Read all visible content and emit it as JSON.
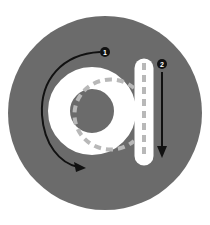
{
  "illustration": {
    "letter": "a",
    "description": "Letter tracing guide",
    "strokes": [
      {
        "number": "1",
        "direction": "counter-clockwise curve"
      },
      {
        "number": "2",
        "direction": "downward line"
      }
    ]
  },
  "colors": {
    "background": "#ffffff",
    "circle": "#6b6b6b",
    "letter_fill": "#ffffff",
    "dash": "#b8b8b8",
    "arrow": "#111111"
  }
}
